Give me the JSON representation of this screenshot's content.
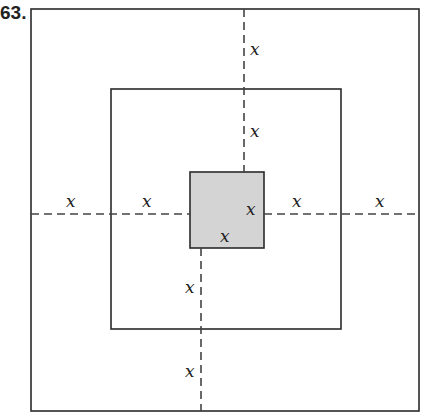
{
  "problem": {
    "number": "63."
  },
  "diagram": {
    "outer_square": {
      "label": "outer-square"
    },
    "middle_square": {
      "label": "middle-square"
    },
    "inner_square": {
      "label": "inner-square",
      "fill": "#d4d4d4"
    },
    "labels": {
      "top_outer": "x",
      "top_middle": "x",
      "left_outer": "x",
      "left_middle": "x",
      "right_middle": "x",
      "right_outer": "x",
      "bottom_middle": "x",
      "bottom_outer": "x",
      "inner_right": "x",
      "inner_bottom": "x"
    },
    "colors": {
      "stroke": "#2a2a2a",
      "dash": "#444444"
    }
  }
}
